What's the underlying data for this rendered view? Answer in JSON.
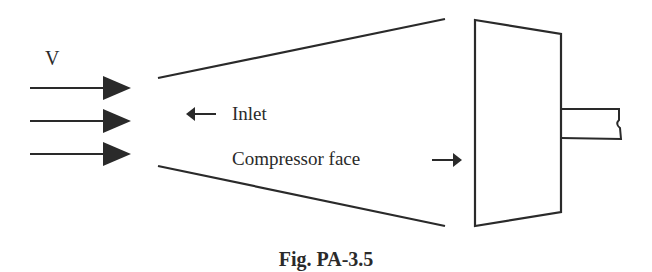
{
  "figure": {
    "caption": "Fig. PA-3.5",
    "labels": {
      "velocity": "V",
      "inlet": "Inlet",
      "compressor_face": "Compressor face"
    },
    "elements": {
      "flow_arrows": 3,
      "inlet_arrow_direction": "left",
      "compressor_face_arrow_direction": "right"
    },
    "colors": {
      "stroke": "#2a2a2a",
      "background": "#ffffff"
    }
  }
}
